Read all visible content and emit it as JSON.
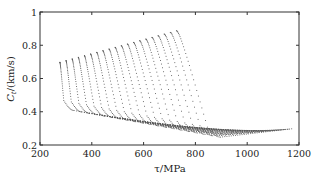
{
  "chart_data": {
    "type": "scatter",
    "title": "",
    "xlabel": "τ/MPa",
    "ylabel": "C_t/(km/s)",
    "ylabel_main": "C",
    "ylabel_sub": "t",
    "ylabel_rest": "/(km/s)",
    "xlim": [
      200,
      1200
    ],
    "ylim": [
      0.2,
      1.0
    ],
    "xticks": [
      200,
      400,
      600,
      800,
      1000,
      1200
    ],
    "yticks": [
      0.2,
      0.4,
      0.6,
      0.8,
      1.0
    ],
    "xtick_labels": [
      "200",
      "400",
      "600",
      "800",
      "1000",
      "1200"
    ],
    "ytick_labels": [
      "0.2",
      "0.4",
      "0.6",
      "0.8",
      "1"
    ],
    "grid": false,
    "legend": null,
    "marker_color": "#555555",
    "series_count": 20,
    "series_description": "Family of dotted curves; each starts high at left and descends, turning to a shallow tail toward higher τ",
    "series": [
      {
        "name": "curve 1",
        "start": [
          275,
          0.7
        ],
        "knee": [
          290,
          0.48
        ],
        "min": [
          330,
          0.41
        ],
        "end": [
          900,
          0.26
        ]
      },
      {
        "name": "curve 10",
        "start": [
          478,
          0.79
        ],
        "knee": [
          560,
          0.38
        ],
        "min": [
          620,
          0.31
        ],
        "end": [
          1000,
          0.27
        ]
      },
      {
        "name": "curve 20",
        "start": [
          725,
          0.89
        ],
        "knee": [
          845,
          0.3
        ],
        "min": [
          895,
          0.25
        ],
        "end": [
          1170,
          0.3
        ]
      }
    ],
    "envelope": {
      "top_starts": [
        [
          275,
          0.7
        ],
        [
          725,
          0.89
        ]
      ],
      "lower_boundary": [
        [
          290,
          0.43
        ],
        [
          400,
          0.37
        ],
        [
          600,
          0.31
        ],
        [
          800,
          0.27
        ],
        [
          895,
          0.25
        ]
      ],
      "tail_end": [
        1170,
        0.3
      ]
    }
  }
}
